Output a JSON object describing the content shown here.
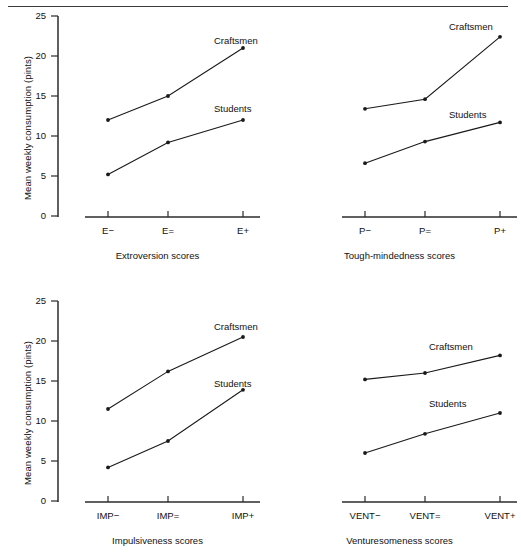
{
  "figure": {
    "has_top_rule": true,
    "y_axis_label": "Mean weekly consumption (pints)",
    "y_ticks": [
      "0",
      "5",
      "10",
      "15",
      "20",
      "25"
    ],
    "series_names": [
      "Craftsmen",
      "Students"
    ],
    "line_color": "#1a1a1a",
    "axis_color": "#2b2b2b"
  },
  "chart_data": [
    {
      "type": "line",
      "panel": "top-left",
      "title": "",
      "xlabel": "Extroversion scores",
      "ylabel": "Mean weekly consumption (pints)",
      "categories": [
        "E−",
        "E=",
        "E+"
      ],
      "ylim": [
        0,
        25
      ],
      "yticks": [
        0,
        5,
        10,
        15,
        20,
        25
      ],
      "grid": false,
      "y_axis_visible": true,
      "legend": "inline-labels",
      "series": [
        {
          "name": "Craftsmen",
          "values": [
            12.0,
            15.0,
            21.0
          ]
        },
        {
          "name": "Students",
          "values": [
            5.2,
            9.2,
            12.0
          ]
        }
      ]
    },
    {
      "type": "line",
      "panel": "top-right",
      "title": "",
      "xlabel": "Tough-mindedness scores",
      "ylabel": "",
      "categories": [
        "P−",
        "P=",
        "P+"
      ],
      "ylim": [
        0,
        25
      ],
      "yticks": [],
      "grid": false,
      "y_axis_visible": false,
      "legend": "inline-labels",
      "series": [
        {
          "name": "Craftsmen",
          "values": [
            13.4,
            14.6,
            22.4
          ]
        },
        {
          "name": "Students",
          "values": [
            6.6,
            9.3,
            11.7
          ]
        }
      ]
    },
    {
      "type": "line",
      "panel": "bottom-left",
      "title": "",
      "xlabel": "Impulsiveness scores",
      "ylabel": "Mean weekly consumption (pints)",
      "categories": [
        "IMP−",
        "IMP=",
        "IMP+"
      ],
      "ylim": [
        0,
        25
      ],
      "yticks": [
        0,
        5,
        10,
        15,
        20,
        25
      ],
      "grid": false,
      "y_axis_visible": true,
      "legend": "inline-labels",
      "series": [
        {
          "name": "Craftsmen",
          "values": [
            11.5,
            16.2,
            20.5
          ]
        },
        {
          "name": "Students",
          "values": [
            4.2,
            7.5,
            13.9
          ]
        }
      ]
    },
    {
      "type": "line",
      "panel": "bottom-right",
      "title": "",
      "xlabel": "Venturesomeness scores",
      "ylabel": "",
      "categories": [
        "VENT−",
        "VENT=",
        "VENT+"
      ],
      "ylim": [
        0,
        25
      ],
      "yticks": [],
      "grid": false,
      "y_axis_visible": false,
      "legend": "inline-labels",
      "series": [
        {
          "name": "Craftsmen",
          "values": [
            15.2,
            16.0,
            18.2
          ]
        },
        {
          "name": "Students",
          "values": [
            6.0,
            8.4,
            11.0
          ]
        }
      ]
    }
  ]
}
